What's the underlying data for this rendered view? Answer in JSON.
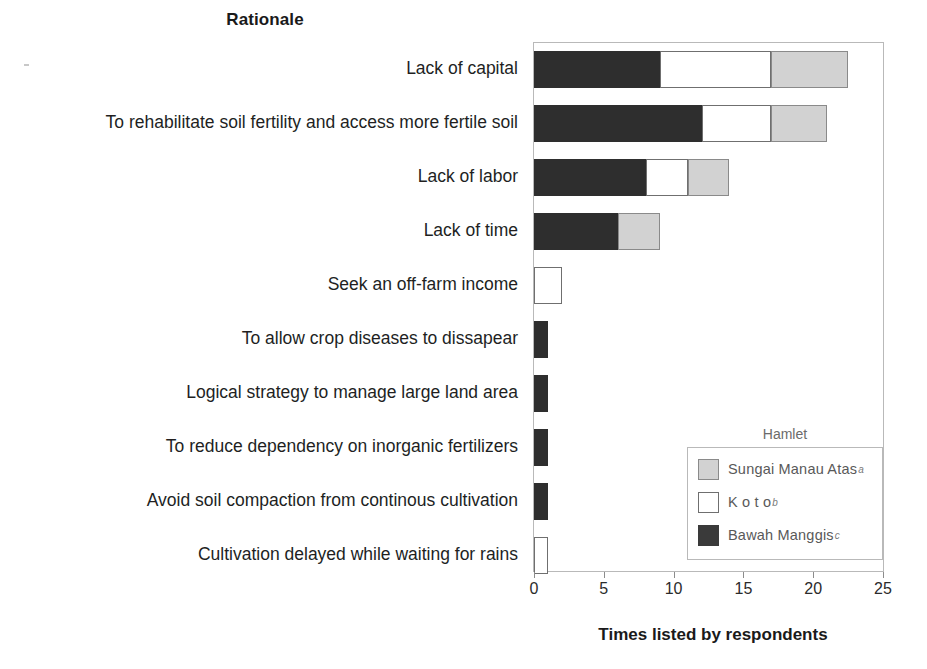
{
  "chart_data": {
    "type": "bar",
    "orientation": "horizontal",
    "stacked": true,
    "title": "Rationale",
    "xlabel": "Times listed by respondents",
    "ylabel": "",
    "xlim": [
      0,
      25
    ],
    "xticks": [
      0,
      5,
      10,
      15,
      20,
      25
    ],
    "xtick_labels": [
      "0",
      "5",
      "10",
      "15",
      "20",
      "25"
    ],
    "grid": false,
    "legend_position": "inside-bottom-right",
    "legend_title": "Hamlet",
    "categories": [
      "Lack of capital",
      "To rehabilitate soil fertility and access more fertile soil",
      "Lack of labor",
      "Lack of time",
      "Seek an off-farm income",
      "To allow crop diseases to dissapear",
      "Logical strategy to manage large land area",
      "To reduce dependency on inorganic fertilizers",
      "Avoid soil compaction from continous cultivation",
      "Cultivation delayed while waiting for rains"
    ],
    "series": [
      {
        "name": "Bawah Manggis",
        "superscript": "c",
        "color": "#2e2e2e",
        "swatch": "dark",
        "values": [
          9,
          12,
          8,
          6,
          0,
          1,
          1,
          1,
          1,
          0
        ]
      },
      {
        "name": "Koto",
        "superscript": "b",
        "color": "#ffffff",
        "swatch": "white",
        "values": [
          8,
          5,
          3,
          0,
          2,
          0,
          0,
          0,
          0,
          1
        ]
      },
      {
        "name": "Sungai Manau Atas",
        "superscript": "a",
        "color": "#d2d2d2",
        "swatch": "gray",
        "values": [
          5.5,
          4,
          3,
          3,
          0,
          0,
          0,
          0,
          0,
          0
        ]
      }
    ],
    "totals": [
      22.5,
      21,
      14,
      9,
      2,
      1,
      1,
      1,
      1,
      1
    ]
  },
  "legend": {
    "title": "Hamlet",
    "items": [
      {
        "label": "Sungai Manau Atas",
        "sup": "a",
        "swatch": "gray"
      },
      {
        "label": "Koto",
        "sup": "b",
        "swatch": "white"
      },
      {
        "label": "Bawah Manggis",
        "sup": "c",
        "swatch": "dark"
      }
    ]
  },
  "colors": {
    "dark": "#2e2e2e",
    "white": "#ffffff",
    "gray": "#d2d2d2",
    "frame": "#b9b9b9",
    "text": "#231f20"
  }
}
